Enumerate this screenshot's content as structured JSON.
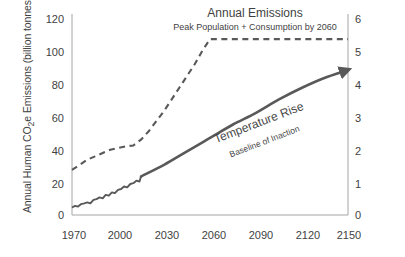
{
  "chart_data": {
    "type": "line",
    "title": "Annual Emissions",
    "subtitle": "Peak Population + Consumption by 2060",
    "xlabel": "",
    "ylabel": "Annual Human CO2e Emissions (billion tonnes)",
    "y2label": "Temperature Change (°C since 1900)",
    "xlim": [
      1970,
      2150
    ],
    "ylim": [
      0,
      120
    ],
    "y2lim": [
      0,
      6
    ],
    "grid": false,
    "legend": "none (inline annotations)",
    "x_ticks": [
      "1970",
      "2000",
      "2030",
      "2060",
      "2090",
      "2120",
      "2150"
    ],
    "y_left_ticks": [
      "0",
      "20",
      "40",
      "60",
      "80",
      "100",
      "120"
    ],
    "y_right_ticks": [
      "0",
      "1",
      "2",
      "3",
      "4",
      "5",
      "6"
    ],
    "annotations": [
      {
        "text": "Temperature Rise",
        "note": "label on solid line",
        "rotation_deg": -21
      },
      {
        "text": "Baseline of Inaction",
        "note": "sub-label on solid line",
        "rotation_deg": -21
      }
    ],
    "series": [
      {
        "name": "Annual Emissions",
        "style": "dashed",
        "color": "#595959",
        "axis": "left",
        "x": [
          1970,
          1975,
          1980,
          1985,
          1990,
          1995,
          2000,
          2005,
          2010,
          2015,
          2020,
          2025,
          2030,
          2035,
          2040,
          2045,
          2050,
          2055,
          2060,
          2080,
          2100,
          2120,
          2150
        ],
        "values": [
          27,
          30,
          33,
          35,
          37,
          39,
          40,
          41,
          41.5,
          45,
          50,
          56,
          62,
          69,
          76,
          83,
          90,
          98,
          105,
          105,
          105,
          105,
          105
        ]
      },
      {
        "name": "Historical Emissions (observed, noisy)",
        "style": "solid-noisy",
        "color": "#595959",
        "axis": "left",
        "x": [
          1970,
          1972,
          1974,
          1976,
          1978,
          1980,
          1982,
          1984,
          1986,
          1988,
          1990,
          1992,
          1994,
          1996,
          1998,
          2000,
          2002,
          2004,
          2006,
          2008,
          2010,
          2012,
          2014,
          2015
        ],
        "values": [
          4.5,
          5.5,
          5.0,
          6.5,
          7.0,
          7.5,
          7.0,
          9.0,
          9.5,
          10.5,
          10.0,
          12.0,
          11.5,
          13.5,
          13.0,
          15.0,
          15.5,
          17.0,
          16.5,
          18.5,
          19.0,
          20.5,
          20.0,
          23.0
        ]
      },
      {
        "name": "Temperature Rise",
        "style": "solid-arrow",
        "color": "#595959",
        "axis": "right",
        "x": [
          2015,
          2030,
          2045,
          2060,
          2075,
          2090,
          2105,
          2120,
          2135,
          2148
        ],
        "values": [
          1.15,
          1.5,
          1.9,
          2.3,
          2.7,
          3.05,
          3.45,
          3.8,
          4.1,
          4.3
        ]
      }
    ]
  },
  "colors": {
    "ink": "#3f3f3f",
    "line": "#595959",
    "axis": "#a6a6a6",
    "background": "#ffffff"
  }
}
